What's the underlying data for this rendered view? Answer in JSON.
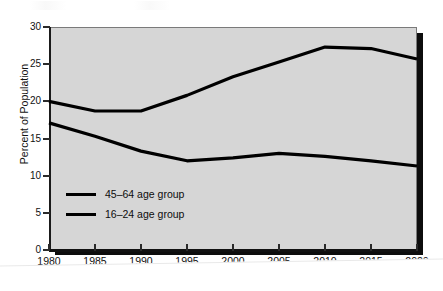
{
  "chart_data": {
    "type": "line",
    "title": "",
    "xlabel": "Year",
    "ylabel": "Percent of Population",
    "x": [
      1980,
      1985,
      1990,
      1995,
      2000,
      2005,
      2010,
      2015,
      2020
    ],
    "xticklabels": [
      "1980",
      "1985",
      "1990",
      "1995",
      "2000",
      "2005",
      "2010",
      "2015",
      "2020"
    ],
    "yticklabels": [
      "0",
      "5",
      "10",
      "15",
      "20",
      "25",
      "30"
    ],
    "yticks": [
      0,
      5,
      10,
      15,
      20,
      25,
      30
    ],
    "xlim": [
      1980,
      2020
    ],
    "ylim": [
      0,
      30
    ],
    "grid": false,
    "legend_position": "inside-lower-left",
    "series": [
      {
        "name": "45–64 age group",
        "color": "#000000",
        "values": [
          20.0,
          18.7,
          18.7,
          20.8,
          23.3,
          25.3,
          27.3,
          27.1,
          25.7
        ]
      },
      {
        "name": "16–24 age group",
        "color": "#000000",
        "values": [
          17.1,
          15.3,
          13.3,
          12.0,
          12.4,
          13.0,
          12.6,
          12.0,
          11.3
        ]
      }
    ]
  },
  "legend": {
    "items": [
      {
        "label": "45–64 age group"
      },
      {
        "label": "16–24 age group"
      }
    ]
  },
  "axes": {
    "x_title": "Year",
    "y_title": "Percent of Population"
  },
  "colors": {
    "plot_background": "#d6d6d6",
    "line": "#000000",
    "page_background": "#ffffff",
    "shadow": "#0d0d0d"
  }
}
